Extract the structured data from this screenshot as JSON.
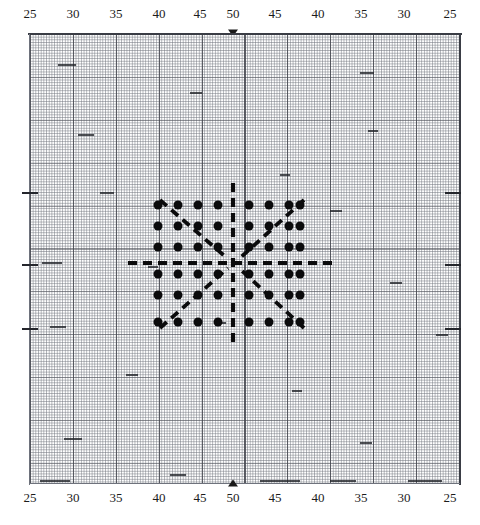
{
  "figure": {
    "title": "",
    "kind": "dot-pattern-on-graph-paper"
  },
  "axes": {
    "top": {
      "name": "top-axis",
      "tick_labels": [
        "25",
        "30",
        "35",
        "40",
        "45",
        "50",
        "45",
        "40",
        "35",
        "30",
        "25"
      ],
      "center_marker": "arrow-down-icon"
    },
    "bottom": {
      "name": "bottom-axis",
      "tick_labels": [
        "25",
        "30",
        "35",
        "40",
        "45",
        "50",
        "45",
        "40",
        "35",
        "30",
        "25"
      ],
      "center_marker": "arrow-up-icon"
    }
  },
  "colors": {
    "ink": "#0b0b0c",
    "grid_minor": "#5a5f69",
    "grid_major": "#46484f",
    "frame": "#3a3d45",
    "paper": "#ffffff"
  },
  "chart_data": {
    "type": "scatter",
    "title": "",
    "xlabel": "",
    "ylabel": "",
    "grid": true,
    "legend": "none",
    "x_tick_labels": [
      "25",
      "30",
      "35",
      "40",
      "45",
      "50",
      "45",
      "40",
      "35",
      "30",
      "25"
    ],
    "x_tick_values": [
      25,
      30,
      35,
      40,
      45,
      50,
      45,
      40,
      35,
      30,
      25
    ],
    "xlim": [
      25,
      25
    ],
    "note": "Symmetric scale increasing 25 to 50 at centre then decreasing back to 25",
    "dot_grid": {
      "columns": 8,
      "rows": 6,
      "col_centers_px": [
        158,
        178,
        198,
        218,
        249,
        269,
        289,
        300
      ],
      "row_centers_px": [
        205,
        226,
        247,
        274,
        295,
        322
      ],
      "total_dots": 48
    },
    "overlays": [
      {
        "name": "vertical-axis-dash",
        "orientation": "vertical",
        "x_px": 233,
        "y1_px": 183,
        "y2_px": 344,
        "style": "dashed"
      },
      {
        "name": "horizontal-axis-dash",
        "orientation": "horizontal",
        "y_px": 263,
        "x1_px": 128,
        "x2_px": 338,
        "style": "dashed"
      },
      {
        "name": "ray-upper-left",
        "x1_px": 160,
        "y1_px": 200,
        "x2_px": 228,
        "y2_px": 259,
        "style": "dashed"
      },
      {
        "name": "ray-upper-right",
        "x1_px": 304,
        "y1_px": 200,
        "x2_px": 239,
        "y2_px": 259,
        "style": "dashed"
      },
      {
        "name": "ray-lower-left",
        "x1_px": 160,
        "y1_px": 328,
        "x2_px": 228,
        "y2_px": 268,
        "style": "dashed"
      },
      {
        "name": "ray-lower-right",
        "x1_px": 304,
        "y1_px": 328,
        "x2_px": 239,
        "y2_px": 268,
        "style": "dashed"
      }
    ]
  }
}
